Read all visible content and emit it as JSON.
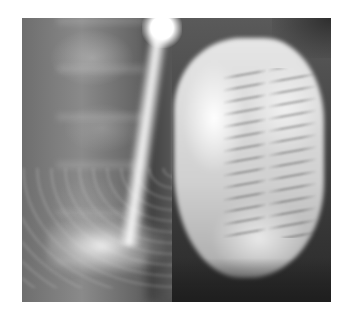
{
  "image": {
    "kind": "radiograph",
    "description": "Grayscale abdominal X-ray with contrast-filled bowel loops on the right and spine/pelvis on the left",
    "frame": {
      "x": 22,
      "y": 18,
      "width": 309,
      "height": 284
    },
    "colors": {
      "background": "#ffffff",
      "contrast_bright": "#f0f0f0",
      "soft_tissue": "#5a5a5a",
      "dark_region": "#2a2a2a"
    }
  }
}
